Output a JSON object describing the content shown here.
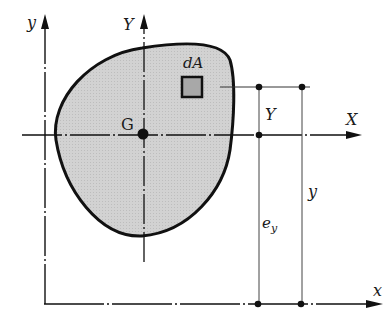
{
  "diagram": {
    "labels": {
      "global_y_axis": "y",
      "global_x_axis": "x",
      "centroid_Y_axis": "Y",
      "centroid_X_axis": "X",
      "centroid": "G",
      "area_element": "dA",
      "element_Y_dimension": "Y",
      "element_y_dimension": "y",
      "centroid_offset": "e",
      "centroid_offset_subscript": "y"
    },
    "colors": {
      "region_fill": "#d0d0d0",
      "element_fill": "#a8a8a8",
      "stroke": "#111111"
    }
  }
}
